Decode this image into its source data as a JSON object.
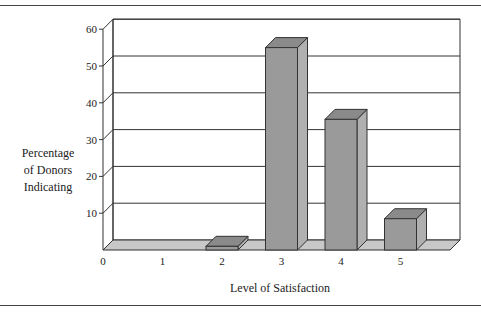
{
  "chart_data": {
    "type": "bar",
    "style": "3d",
    "title": "",
    "xlabel": "Level of Satisfaction",
    "ylabel": "Percentage of Donors Indicating",
    "ylabel_lines": [
      "Percentage",
      "of Donors",
      "Indicating"
    ],
    "categories": [
      "1",
      "2",
      "3",
      "4",
      "5"
    ],
    "x_ticks": [
      "0",
      "1",
      "2",
      "3",
      "4",
      "5"
    ],
    "values": [
      0,
      1,
      55,
      35.5,
      8.5
    ],
    "y_ticks": [
      "10",
      "20",
      "30",
      "40",
      "50",
      "60"
    ],
    "ylim": [
      0,
      60
    ],
    "grid": true,
    "legend": null,
    "colors": {
      "bar": "#9a9a9a",
      "bar_top": "#8a8a8a",
      "bar_side": "#b0b0b0",
      "floor": "#c8c8c8"
    }
  }
}
